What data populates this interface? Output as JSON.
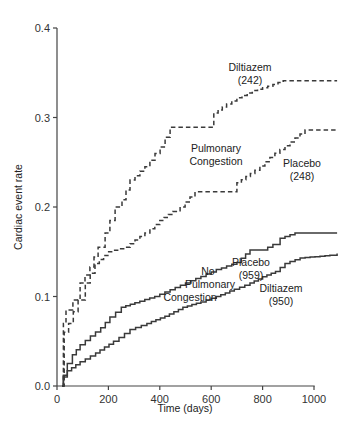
{
  "chart_data": {
    "type": "line",
    "subtype": "kaplan-meier step curves",
    "title": "",
    "xlabel": "Time (days)",
    "ylabel": "Cardiac event rate",
    "xlim": [
      0,
      1100
    ],
    "ylim": [
      0.0,
      0.4
    ],
    "xticks": [
      0,
      200,
      400,
      600,
      800,
      1000
    ],
    "xtick_labels": [
      "0",
      "200",
      "400",
      "600",
      "800",
      "1000"
    ],
    "yticks": [
      0.0,
      0.1,
      0.2,
      0.3,
      0.4
    ],
    "ytick_labels": [
      "0.0",
      "0.1",
      "0.2",
      "0.3",
      "0.4"
    ],
    "grid": false,
    "legend": "none (inline annotations)",
    "series": [
      {
        "name": "Diltiazem (242) - Pulmonary Congestion",
        "group": "Pulmonary Congestion",
        "treatment": "Diltiazem",
        "n": 242,
        "style": "dashed",
        "x": [
          20,
          25,
          35,
          62,
          90,
          128,
          160,
          187,
          206,
          226,
          253,
          284,
          342,
          401,
          440,
          590,
          610,
          660,
          700,
          760,
          820,
          880,
          1090
        ],
        "y": [
          0.0,
          0.07,
          0.085,
          0.096,
          0.115,
          0.133,
          0.155,
          0.171,
          0.185,
          0.2,
          0.208,
          0.23,
          0.245,
          0.267,
          0.289,
          0.289,
          0.305,
          0.315,
          0.322,
          0.33,
          0.335,
          0.341,
          0.341
        ]
      },
      {
        "name": "Placebo (248) - Pulmonary Congestion",
        "group": "Pulmonary Congestion",
        "treatment": "Placebo",
        "n": 248,
        "style": "dashed",
        "x": [
          20,
          28,
          45,
          82,
          110,
          148,
          198,
          265,
          342,
          400,
          450,
          479,
          537,
          681,
          700,
          770,
          848,
          926,
          965,
          1090
        ],
        "y": [
          0.0,
          0.06,
          0.07,
          0.096,
          0.115,
          0.137,
          0.15,
          0.155,
          0.171,
          0.185,
          0.195,
          0.2,
          0.217,
          0.217,
          0.227,
          0.241,
          0.26,
          0.277,
          0.286,
          0.286
        ]
      },
      {
        "name": "Placebo (959) - No Pulmonary Congestion",
        "group": "No Pulmonary Congestion",
        "treatment": "Placebo",
        "n": 959,
        "style": "solid",
        "x": [
          20,
          25,
          40,
          60,
          90,
          130,
          170,
          206,
          250,
          303,
          380,
          460,
          540,
          620,
          700,
          751,
          800,
          840,
          868,
          926,
          1090
        ],
        "y": [
          0.0,
          0.012,
          0.025,
          0.035,
          0.046,
          0.056,
          0.065,
          0.077,
          0.088,
          0.093,
          0.1,
          0.11,
          0.12,
          0.13,
          0.138,
          0.152,
          0.152,
          0.158,
          0.165,
          0.171,
          0.171
        ]
      },
      {
        "name": "Diltiazem (950) - No Pulmonary Congestion",
        "group": "No Pulmonary Congestion",
        "treatment": "Diltiazem",
        "n": 950,
        "style": "solid",
        "x": [
          20,
          25,
          40,
          90,
          150,
          220,
          284,
          350,
          420,
          490,
          560,
          620,
          690,
          751,
          800,
          850,
          887,
          946,
          1062,
          1090
        ],
        "y": [
          0.0,
          0.01,
          0.017,
          0.027,
          0.037,
          0.05,
          0.063,
          0.07,
          0.078,
          0.088,
          0.094,
          0.1,
          0.108,
          0.115,
          0.122,
          0.128,
          0.137,
          0.143,
          0.146,
          0.148
        ]
      }
    ],
    "annotations": [
      {
        "id": "diltiazem-242",
        "lines": [
          "Diltiazem",
          "(242)"
        ],
        "x": 250,
        "y": 67,
        "anchor": "middle"
      },
      {
        "id": "pulmonary-congestion",
        "lines": [
          "Pulmonary",
          "Congestion"
        ],
        "x": 216,
        "y": 148,
        "anchor": "middle"
      },
      {
        "id": "placebo-248",
        "lines": [
          "Placebo",
          "(248)"
        ],
        "x": 302,
        "y": 163,
        "anchor": "middle"
      },
      {
        "id": "placebo-959",
        "lines": [
          "Placebo",
          "(959)"
        ],
        "x": 251,
        "y": 262,
        "anchor": "middle"
      },
      {
        "id": "no-pulmonary-congestion",
        "lines": [
          "No",
          "Pulmonary",
          "Congestion"
        ],
        "x": 208,
        "y": 271,
        "anchor": "custom"
      },
      {
        "id": "diltiazem-950",
        "lines": [
          "Diltiazem",
          "(950)"
        ],
        "x": 281,
        "y": 288,
        "anchor": "middle"
      }
    ]
  }
}
